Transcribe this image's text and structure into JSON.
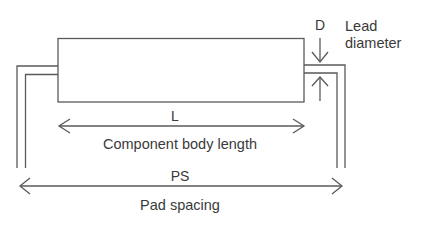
{
  "diagram": {
    "type": "component-lead-dimensions",
    "labels": {
      "body_length_symbol": "L",
      "body_length_text": "Component body length",
      "pad_spacing_symbol": "PS",
      "pad_spacing_text": "Pad spacing",
      "lead_diameter_symbol": "D",
      "lead_diameter_text_line1": "Lead",
      "lead_diameter_text_line2": "diameter"
    },
    "colors": {
      "stroke": "#5a5a5a",
      "text": "#3a3a3a",
      "background": "#ffffff"
    }
  }
}
